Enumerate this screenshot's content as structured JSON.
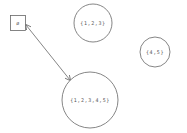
{
  "diagram": {
    "nodes": [
      {
        "id": "empty",
        "label": "ø",
        "shape": "square"
      },
      {
        "id": "s123",
        "label": "{1,2,3}",
        "shape": "circle"
      },
      {
        "id": "s45",
        "label": "{4,5}",
        "shape": "circle"
      },
      {
        "id": "s12345",
        "label": "{1,2,3,4,5}",
        "shape": "circle"
      }
    ],
    "edges": [
      {
        "from": "empty",
        "to": "s12345",
        "bidirectional": true
      }
    ],
    "colors": {
      "stroke": "#666666",
      "text": "#555555",
      "background": "#ffffff"
    }
  }
}
